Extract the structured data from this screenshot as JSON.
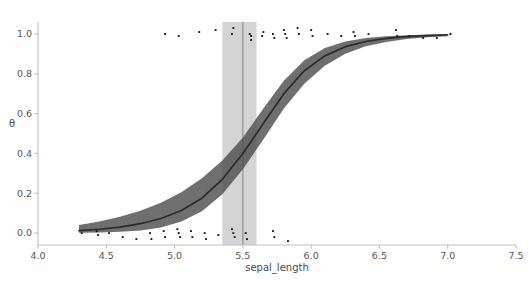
{
  "figure": {
    "background_color": "#ffffff",
    "width": 529,
    "height": 283
  },
  "chart_data": {
    "type": "line",
    "title": "",
    "subtitle": "",
    "xlabel": "sepal_length",
    "ylabel": "θ",
    "xlim": [
      4.0,
      7.5
    ],
    "ylim": [
      -0.06,
      1.06
    ],
    "xticks": [
      "4.0",
      "4.5",
      "5.0",
      "5.5",
      "6.0",
      "6.5",
      "7.0",
      "7.5"
    ],
    "xtick_values": [
      4.0,
      4.5,
      5.0,
      5.5,
      6.0,
      6.5,
      7.0,
      7.5
    ],
    "yticks": [
      "0.0",
      "0.2",
      "0.4",
      "0.6",
      "0.8",
      "1.0"
    ],
    "ytick_values": [
      0.0,
      0.2,
      0.4,
      0.6,
      0.8,
      1.0
    ],
    "grid": false,
    "legend": "none",
    "colors": {
      "line": "#2b2b2b",
      "hdi_band": "#4f4f4f",
      "boundary_band": "#b0b0b0",
      "boundary_line": "#8a8a8a",
      "points": "#1a1a1a",
      "spine": "#bfbfbf",
      "tick_text": "#555555"
    },
    "series": [
      {
        "name": "mean theta",
        "type": "line",
        "x": [
          4.3,
          4.45,
          4.6,
          4.75,
          4.9,
          5.05,
          5.2,
          5.35,
          5.5,
          5.65,
          5.8,
          5.95,
          6.1,
          6.25,
          6.4,
          6.55,
          6.7,
          6.85,
          7.0
        ],
        "values": [
          0.012,
          0.019,
          0.03,
          0.047,
          0.073,
          0.113,
          0.175,
          0.27,
          0.4,
          0.55,
          0.7,
          0.815,
          0.89,
          0.936,
          0.962,
          0.978,
          0.987,
          0.992,
          0.996
        ]
      },
      {
        "name": "94% HDI lower",
        "type": "band_lower",
        "x": [
          4.3,
          4.45,
          4.6,
          4.75,
          4.9,
          5.05,
          5.2,
          5.35,
          5.5,
          5.65,
          5.8,
          5.95,
          6.1,
          6.25,
          6.4,
          6.55,
          6.7,
          6.85,
          7.0
        ],
        "values": [
          0.001,
          0.003,
          0.006,
          0.013,
          0.028,
          0.058,
          0.11,
          0.195,
          0.32,
          0.47,
          0.625,
          0.75,
          0.84,
          0.9,
          0.938,
          0.96,
          0.974,
          0.983,
          0.989
        ]
      },
      {
        "name": "94% HDI upper",
        "type": "band_upper",
        "x": [
          4.3,
          4.45,
          4.6,
          4.75,
          4.9,
          5.05,
          5.2,
          5.35,
          5.5,
          5.65,
          5.8,
          5.95,
          6.1,
          6.25,
          6.4,
          6.55,
          6.7,
          6.85,
          7.0
        ],
        "values": [
          0.04,
          0.058,
          0.082,
          0.112,
          0.152,
          0.205,
          0.275,
          0.365,
          0.48,
          0.625,
          0.765,
          0.868,
          0.93,
          0.962,
          0.98,
          0.989,
          0.994,
          0.997,
          0.999
        ]
      }
    ],
    "boundary": {
      "name": "decision boundary 94% HDI",
      "center": 5.5,
      "low": 5.35,
      "high": 5.6
    },
    "scatter": {
      "name": "observed data (jittered)",
      "points_y1": [
        [
          4.93,
          1.0
        ],
        [
          5.03,
          0.99
        ],
        [
          5.18,
          1.01
        ],
        [
          5.3,
          1.02
        ],
        [
          5.42,
          1.0
        ],
        [
          5.43,
          1.03
        ],
        [
          5.55,
          1.0
        ],
        [
          5.56,
          0.99
        ],
        [
          5.56,
          0.97
        ],
        [
          5.64,
          0.99
        ],
        [
          5.65,
          1.01
        ],
        [
          5.72,
          1.0
        ],
        [
          5.73,
          0.98
        ],
        [
          5.8,
          1.02
        ],
        [
          5.81,
          1.0
        ],
        [
          5.82,
          0.98
        ],
        [
          5.9,
          1.03
        ],
        [
          5.91,
          1.0
        ],
        [
          6.0,
          1.02
        ],
        [
          6.01,
          0.99
        ],
        [
          6.12,
          1.0
        ],
        [
          6.22,
          0.99
        ],
        [
          6.31,
          1.01
        ],
        [
          6.32,
          0.99
        ],
        [
          6.42,
          1.0
        ],
        [
          6.62,
          1.02
        ],
        [
          6.63,
          0.99
        ],
        [
          6.72,
          0.99
        ],
        [
          6.82,
          0.98
        ],
        [
          6.92,
          0.98
        ],
        [
          7.02,
          1.0
        ]
      ],
      "points_y0": [
        [
          4.32,
          0.0
        ],
        [
          4.43,
          0.01
        ],
        [
          4.44,
          -0.01
        ],
        [
          4.52,
          0.0
        ],
        [
          4.62,
          -0.02
        ],
        [
          4.72,
          -0.03
        ],
        [
          4.82,
          0.0
        ],
        [
          4.83,
          -0.03
        ],
        [
          4.92,
          0.01
        ],
        [
          4.93,
          -0.02
        ],
        [
          5.02,
          0.02
        ],
        [
          5.03,
          0.0
        ],
        [
          5.04,
          -0.02
        ],
        [
          5.12,
          0.01
        ],
        [
          5.13,
          -0.02
        ],
        [
          5.22,
          0.0
        ],
        [
          5.23,
          -0.03
        ],
        [
          5.32,
          -0.01
        ],
        [
          5.42,
          0.02
        ],
        [
          5.43,
          0.0
        ],
        [
          5.44,
          -0.02
        ],
        [
          5.52,
          0.0
        ],
        [
          5.53,
          -0.03
        ],
        [
          5.72,
          0.01
        ],
        [
          5.73,
          -0.02
        ],
        [
          5.83,
          -0.04
        ]
      ]
    }
  }
}
